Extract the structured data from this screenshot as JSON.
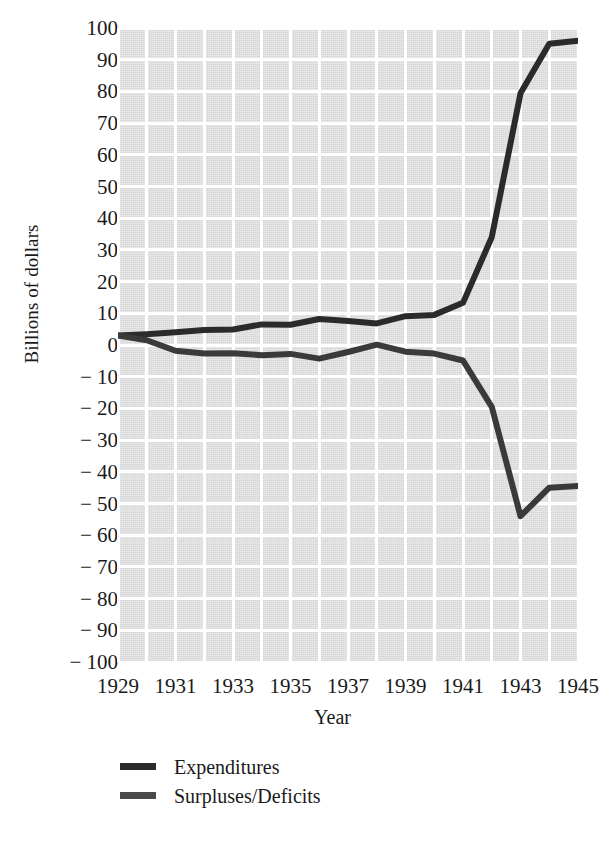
{
  "chart_data": {
    "type": "line",
    "title": "",
    "xlabel": "Year",
    "ylabel": "Billions of dollars",
    "xlim": [
      1929,
      1945
    ],
    "ylim": [
      -100,
      100
    ],
    "grid": true,
    "legend_position": "below-axes-left",
    "x": [
      1929,
      1930,
      1931,
      1932,
      1933,
      1934,
      1935,
      1936,
      1937,
      1938,
      1939,
      1940,
      1941,
      1942,
      1943,
      1944,
      1945
    ],
    "xtick_labels": [
      "1929",
      "1931",
      "1933",
      "1935",
      "1937",
      "1939",
      "1941",
      "1943",
      "1945"
    ],
    "xtick_values": [
      1929,
      1931,
      1933,
      1935,
      1937,
      1939,
      1941,
      1943,
      1945
    ],
    "ytick_labels": [
      "100",
      "90",
      "80",
      "70",
      "60",
      "50",
      "40",
      "30",
      "20",
      "10",
      "0",
      "− 10",
      "− 20",
      "− 30",
      "− 40",
      "− 50",
      "− 60",
      "− 70",
      "− 80",
      "− 90",
      "− 100"
    ],
    "ytick_values": [
      100,
      90,
      80,
      70,
      60,
      50,
      40,
      30,
      20,
      10,
      0,
      -10,
      -20,
      -30,
      -40,
      -50,
      -60,
      -70,
      -80,
      -90,
      -100
    ],
    "series": [
      {
        "name": "Expenditures",
        "color": "#2b2b2b",
        "values": [
          3.0,
          3.4,
          4.0,
          4.7,
          4.9,
          6.5,
          6.4,
          8.2,
          7.6,
          6.8,
          9.1,
          9.5,
          13.3,
          34.0,
          79.4,
          95.0,
          96.0
        ]
      },
      {
        "name": "Surpluses/Deficits",
        "color": "#3a3a3a",
        "values": [
          3.0,
          1.5,
          -1.8,
          -2.7,
          -2.6,
          -3.2,
          -2.8,
          -4.3,
          -2.2,
          0.1,
          -2.1,
          -2.7,
          -4.9,
          -19.5,
          -54.0,
          -45.0,
          -44.5
        ]
      }
    ]
  },
  "legend": {
    "entries": [
      {
        "label": "Expenditures",
        "color": "#2b2b2b"
      },
      {
        "label": "Surpluses/Deficits",
        "color": "#4a4a4a"
      }
    ]
  },
  "colors": {
    "plot_background": "#d6d6d6",
    "gridline": "#ffffff",
    "text": "#1a1a1a",
    "expenditures_line": "#2b2b2b",
    "deficits_line": "#3a3a3a"
  }
}
